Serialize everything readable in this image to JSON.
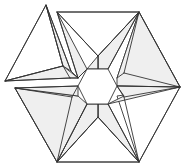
{
  "diagram": {
    "title": "",
    "type": "geometric-star-hexagon-net",
    "colors": {
      "stroke": "#333333",
      "shade": "#efefef",
      "background": "#ffffff"
    },
    "center_hexagon": [
      [
        78,
        86
      ],
      [
        87,
        69
      ],
      [
        108,
        69
      ],
      [
        117,
        86
      ],
      [
        108,
        104
      ],
      [
        87,
        104
      ]
    ],
    "outer_vertices": {
      "top_left_apex": [
        46,
        5
      ],
      "top_edge_left": [
        57,
        12
      ],
      "top_right": [
        139,
        12
      ],
      "right": [
        180,
        87
      ],
      "bottom_right": [
        139,
        162
      ],
      "bottom_left": [
        57,
        162
      ],
      "left_upper": [
        5,
        81
      ],
      "left_lower": [
        15,
        88
      ]
    },
    "shaded_faces": [
      [
        [
          98,
          56
        ],
        [
          139,
          12
        ],
        [
          108,
          69
        ],
        [
          98,
          69
        ]
      ],
      [
        [
          98,
          56
        ],
        [
          87,
          69
        ],
        [
          98,
          69
        ]
      ],
      [
        [
          117,
          78
        ],
        [
          139,
          12
        ],
        [
          180,
          87
        ],
        [
          117,
          86
        ]
      ],
      [
        [
          117,
          86
        ],
        [
          180,
          87
        ],
        [
          108,
          104
        ],
        [
          124,
          96
        ]
      ],
      [
        [
          108,
          104
        ],
        [
          139,
          162
        ],
        [
          98,
          117
        ],
        [
          98,
          104
        ]
      ],
      [
        [
          98,
          117
        ],
        [
          57,
          162
        ],
        [
          87,
          104
        ],
        [
          98,
          104
        ]
      ],
      [
        [
          87,
          104
        ],
        [
          57,
          162
        ],
        [
          15,
          88
        ],
        [
          78,
          96
        ]
      ],
      [
        [
          78,
          86
        ],
        [
          15,
          88
        ],
        [
          78,
          96
        ]
      ],
      [
        [
          63,
          66
        ],
        [
          5,
          81
        ],
        [
          70,
          78
        ],
        [
          78,
          78
        ]
      ],
      [
        [
          71,
          71
        ],
        [
          46,
          5
        ],
        [
          63,
          66
        ]
      ],
      [
        [
          78,
          78
        ],
        [
          57,
          12
        ],
        [
          87,
          69
        ]
      ]
    ],
    "white_faces": [
      [
        [
          46,
          5
        ],
        [
          5,
          81
        ],
        [
          63,
          66
        ]
      ],
      [
        [
          57,
          12
        ],
        [
          139,
          12
        ],
        [
          98,
          56
        ]
      ],
      [
        [
          139,
          12
        ],
        [
          180,
          87
        ],
        [
          117,
          78
        ]
      ],
      [
        [
          180,
          87
        ],
        [
          139,
          162
        ],
        [
          117,
          96
        ]
      ],
      [
        [
          57,
          162
        ],
        [
          139,
          162
        ],
        [
          98,
          117
        ]
      ],
      [
        [
          15,
          88
        ],
        [
          57,
          162
        ],
        [
          78,
          96
        ]
      ]
    ],
    "edges": [
      [
        [
          46,
          5
        ],
        [
          5,
          81
        ]
      ],
      [
        [
          5,
          81
        ],
        [
          63,
          66
        ]
      ],
      [
        [
          46,
          5
        ],
        [
          63,
          66
        ]
      ],
      [
        [
          46,
          5
        ],
        [
          71,
          71
        ]
      ],
      [
        [
          63,
          66
        ],
        [
          70,
          78
        ]
      ],
      [
        [
          5,
          81
        ],
        [
          70,
          78
        ]
      ],
      [
        [
          70,
          78
        ],
        [
          78,
          78
        ]
      ],
      [
        [
          71,
          71
        ],
        [
          78,
          78
        ]
      ],
      [
        [
          57,
          12
        ],
        [
          78,
          78
        ]
      ],
      [
        [
          78,
          78
        ],
        [
          87,
          69
        ]
      ],
      [
        [
          57,
          12
        ],
        [
          139,
          12
        ]
      ],
      [
        [
          57,
          12
        ],
        [
          98,
          56
        ]
      ],
      [
        [
          98,
          56
        ],
        [
          139,
          12
        ]
      ],
      [
        [
          98,
          56
        ],
        [
          98,
          69
        ]
      ],
      [
        [
          139,
          12
        ],
        [
          108,
          69
        ]
      ],
      [
        [
          139,
          12
        ],
        [
          124,
          73
        ]
      ],
      [
        [
          124,
          73
        ],
        [
          117,
          78
        ]
      ],
      [
        [
          139,
          12
        ],
        [
          180,
          87
        ]
      ],
      [
        [
          124,
          73
        ],
        [
          180,
          87
        ]
      ],
      [
        [
          117,
          86
        ],
        [
          180,
          87
        ]
      ],
      [
        [
          180,
          87
        ],
        [
          124,
          97
        ]
      ],
      [
        [
          124,
          97
        ],
        [
          117,
          86
        ]
      ],
      [
        [
          180,
          87
        ],
        [
          139,
          162
        ]
      ],
      [
        [
          124,
          97
        ],
        [
          139,
          162
        ]
      ],
      [
        [
          108,
          104
        ],
        [
          139,
          162
        ]
      ],
      [
        [
          139,
          162
        ],
        [
          98,
          117
        ]
      ],
      [
        [
          98,
          117
        ],
        [
          98,
          104
        ]
      ],
      [
        [
          57,
          162
        ],
        [
          139,
          162
        ]
      ],
      [
        [
          57,
          162
        ],
        [
          98,
          117
        ]
      ],
      [
        [
          57,
          162
        ],
        [
          87,
          104
        ]
      ],
      [
        [
          57,
          162
        ],
        [
          72,
          97
        ]
      ],
      [
        [
          72,
          97
        ],
        [
          78,
          86
        ]
      ],
      [
        [
          15,
          88
        ],
        [
          57,
          162
        ]
      ],
      [
        [
          15,
          88
        ],
        [
          72,
          97
        ]
      ],
      [
        [
          15,
          88
        ],
        [
          78,
          86
        ]
      ]
    ]
  }
}
